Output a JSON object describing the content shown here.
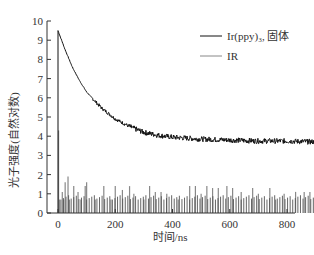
{
  "chart_data": {
    "type": "line",
    "title": "",
    "xlabel": "时间/ns",
    "ylabel": "光子强度(自然对数)",
    "xlim": [
      0,
      930
    ],
    "ylim": [
      0,
      10
    ],
    "xticks": [
      0,
      200,
      400,
      600,
      800
    ],
    "yticks": [
      0,
      1,
      2,
      3,
      4,
      5,
      6,
      7,
      8,
      9,
      10
    ],
    "grid": false,
    "legend_position": "upper right",
    "series": [
      {
        "name": "Ir(ppy)3, 固体",
        "color": "#111111",
        "style": "noisy decay line",
        "x": [
          0,
          10,
          25,
          50,
          75,
          100,
          150,
          200,
          250,
          300,
          350,
          400,
          500,
          600,
          700,
          800,
          900,
          930
        ],
        "values": [
          9.5,
          9.1,
          8.5,
          7.6,
          6.9,
          6.3,
          5.5,
          4.9,
          4.5,
          4.2,
          4.05,
          3.95,
          3.85,
          3.8,
          3.75,
          3.75,
          3.7,
          3.7
        ]
      },
      {
        "name": "IR",
        "color": "#888888",
        "style": "spike histogram",
        "x": [
          2,
          5,
          15,
          20,
          25,
          35,
          40,
          55,
          70,
          80,
          95,
          100,
          130,
          160,
          185,
          200,
          225,
          250,
          265,
          300,
          320,
          340,
          360,
          380,
          420,
          460,
          480,
          500,
          520,
          540,
          560,
          590,
          610,
          640,
          680,
          700,
          740,
          760,
          790,
          830,
          860,
          880,
          900
        ],
        "values": [
          4.3,
          0.7,
          1.1,
          0.7,
          1.6,
          1.9,
          0.7,
          1.4,
          1.1,
          0.7,
          1.4,
          1.6,
          0.7,
          1.4,
          0.7,
          1.4,
          1.2,
          1.4,
          1.0,
          0.7,
          1.4,
          1.1,
          1.1,
          1.0,
          0.7,
          1.4,
          1.4,
          1.0,
          1.4,
          1.3,
          1.3,
          1.4,
          1.3,
          1.1,
          1.3,
          1.0,
          1.3,
          0.7,
          1.0,
          1.1,
          1.1,
          1.1,
          1.1
        ]
      }
    ]
  },
  "legend": {
    "items": [
      {
        "label": "Ir(ppy)₃, 固体",
        "color": "#111111"
      },
      {
        "label": "IR",
        "color": "#888888"
      }
    ]
  },
  "axes": {
    "xlabel": "时间/ns",
    "ylabel": "光子强度(自然对数)"
  }
}
